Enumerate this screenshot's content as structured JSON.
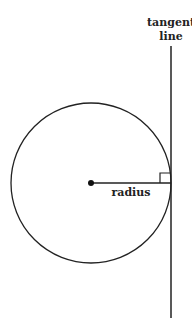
{
  "diagram": {
    "type": "geometry",
    "labels": {
      "tangent_line_1": "tangent",
      "tangent_line_2": "line",
      "radius": "radius"
    },
    "colors": {
      "stroke": "#222222",
      "background": "#ffffff"
    },
    "geometry": {
      "circle": {
        "cx": 91,
        "cy": 183,
        "r": 80
      },
      "tangent_x": 171,
      "tangent_y1": 46,
      "tangent_y2": 318,
      "right_angle_marker_size": 9
    }
  }
}
